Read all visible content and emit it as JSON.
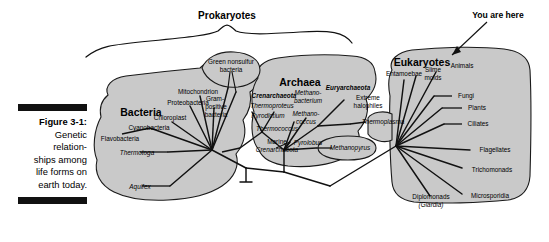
{
  "figure": {
    "label": "Figure 3-1:",
    "caption_lines": [
      "Genetic",
      "relation-",
      "ships among",
      "life forms on",
      "earth today."
    ]
  },
  "annotations": {
    "prokaryotes_brace": "Prokaryotes",
    "you_are_here": "You are here"
  },
  "domains": [
    {
      "name": "Bacteria",
      "taxa": [
        "Green nonsulfur bacteria",
        "Mitochondrion",
        "Gram-positive bacteria",
        "Proteobacteria",
        "Chloroplast",
        "Cyanobacteria",
        "Flavobacteria",
        "Thermotoga",
        "Aquifex"
      ]
    },
    {
      "name": "Archaea",
      "taxa": [
        "Crenarchaeota",
        "Euryarchaeota",
        "Thermoproteus",
        "Pyrodictium",
        "Thermococcus",
        "Marine Crenarchaeota",
        "Methanobacterium",
        "Methanococcus",
        "Pyrolobus",
        "Methanopyrus",
        "Extreme halophiles",
        "Thermoplasma"
      ]
    },
    {
      "name": "Eukaryotes",
      "taxa": [
        "Entamoebae",
        "Slime molds",
        "Animals",
        "Fungi",
        "Plants",
        "Ciliates",
        "Flagellates",
        "Trichomonads",
        "Microsporidia",
        "Diplomonads (Giardia)"
      ]
    }
  ],
  "labels": {
    "bacteria": "Bacteria",
    "archaea": "Archaea",
    "eukaryotes": "Eukaryotes",
    "green_nonsulfur_1": "Green nonsulfur",
    "green_nonsulfur_2": "bacteria",
    "mitochondrion": "Mitochondrion",
    "gram_1": "Gram-",
    "gram_2": "positive",
    "gram_3": "bacteria",
    "proteobacteria": "Proteobacteria",
    "chloroplast": "Chloroplast",
    "cyanobacteria": "Cyanobacteria",
    "flavobacteria": "Flavobacteria",
    "thermotoga": "Thermotoga",
    "aquifex": "Aquifex",
    "crenarchaeota": "Crenarchaeota",
    "thermoproteus": "Thermoproteus",
    "pyrodictium": "Pyrodictium",
    "thermococcus": "Thermococcus",
    "marine_1": "Marine",
    "marine_2": "Crenarchaeota",
    "methanobacterium_1": "Methano-",
    "methanobacterium_2": "bacterium",
    "methanococcus_1": "Methano-",
    "methanococcus_2": "coccus",
    "pyrolobus": "Pyrolobus",
    "methanopyrus": "Methanopyrus",
    "euryarchaeota": "Euryarchaeota",
    "extreme_1": "Extreme",
    "extreme_2": "halophiles",
    "thermoplasma": "Thermoplasma",
    "entamoebae": "Entamoebae",
    "slime_1": "Slime",
    "slime_2": "molds",
    "animals": "Animals",
    "fungi": "Fungi",
    "plants": "Plants",
    "ciliates": "Ciliates",
    "flagellates": "Flagellates",
    "trichomonads": "Trichomonads",
    "microsporidia": "Microsporidia",
    "diplomonads_1": "Diplomonads",
    "diplomonads_2": "(Giardia)"
  },
  "colors": {
    "blob_fill": "#c9c9c9",
    "line": "#111111",
    "background": "#ffffff"
  }
}
